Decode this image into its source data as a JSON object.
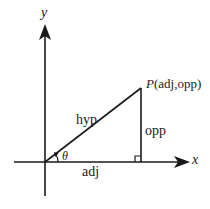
{
  "diagram": {
    "axes": {
      "x_label": "x",
      "y_label": "y"
    },
    "triangle": {
      "hypotenuse_label": "hyp",
      "adjacent_label": "adj",
      "opposite_label": "opp",
      "angle_label": "θ",
      "point_name": "P",
      "point_coords": "(adj,opp)"
    },
    "colors": {
      "stroke": "#1a1a1a",
      "background": "#ffffff"
    }
  }
}
